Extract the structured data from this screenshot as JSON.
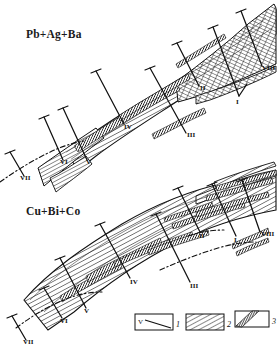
{
  "figure": {
    "kind": "geological-ore-zoning-projection",
    "background_color": "#ffffff",
    "ink_color": "#111111",
    "width": 277,
    "height": 349
  },
  "panels": [
    {
      "id": "upper",
      "title": "Pb+Ag+Ba",
      "title_pos": {
        "x": 26,
        "y": 38
      },
      "section_labels": [
        {
          "text": "I",
          "x": 236,
          "y": 104
        },
        {
          "text": "II",
          "x": 200,
          "y": 90
        },
        {
          "text": "III",
          "x": 187,
          "y": 137
        },
        {
          "text": "IV",
          "x": 124,
          "y": 129
        },
        {
          "text": "V",
          "x": 86,
          "y": 164
        },
        {
          "text": "VI",
          "x": 62,
          "y": 164
        },
        {
          "text": "VII",
          "x": 22,
          "y": 179
        },
        {
          "text": "VIII",
          "x": 264,
          "y": 69
        }
      ]
    },
    {
      "id": "lower",
      "title": "Cu+Bi+Co",
      "title_pos": {
        "x": 26,
        "y": 214
      },
      "section_labels": [
        {
          "text": "I",
          "x": 234,
          "y": 240
        },
        {
          "text": "II",
          "x": 201,
          "y": 236
        },
        {
          "text": "III",
          "x": 190,
          "y": 287
        },
        {
          "text": "IV",
          "x": 130,
          "y": 283
        },
        {
          "text": "V",
          "x": 85,
          "y": 312
        },
        {
          "text": "VI",
          "x": 62,
          "y": 322
        },
        {
          "text": "VII",
          "x": 25,
          "y": 342
        },
        {
          "text": "VIII",
          "x": 263,
          "y": 235
        }
      ]
    }
  ],
  "legend": {
    "items": [
      {
        "number": "1",
        "symbol": "section-line-with-label",
        "inner_text": "V"
      },
      {
        "number": "2",
        "symbol": "diagonal-hatch-host-rock"
      },
      {
        "number": "3",
        "symbol": "dark-diagonal-band-orebody"
      }
    ],
    "boxes": [
      {
        "x": 135,
        "y": 314,
        "w": 38,
        "h": 16
      },
      {
        "x": 186,
        "y": 314,
        "w": 38,
        "h": 16
      },
      {
        "x": 235,
        "y": 311,
        "w": 34,
        "h": 16
      }
    ],
    "number_positions": [
      {
        "x": 176,
        "y": 327
      },
      {
        "x": 227,
        "y": 327
      },
      {
        "x": 272,
        "y": 324
      }
    ]
  }
}
